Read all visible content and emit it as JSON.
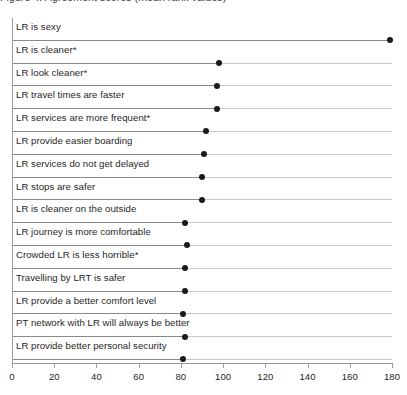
{
  "chart": {
    "title_clipped": "Figure 4: Agreement scores (mean rank values)",
    "xlabel": "",
    "ylabel": ""
  },
  "chart_data": {
    "type": "bar",
    "orientation": "horizontal",
    "style": "lollipop",
    "title": "Figure 4: Agreement scores (mean rank values)",
    "xlabel": "",
    "ylabel": "",
    "xlim": [
      0,
      180
    ],
    "xticks": [
      0,
      20,
      40,
      60,
      80,
      100,
      120,
      140,
      160,
      180
    ],
    "grid": false,
    "legend": null,
    "categories": [
      "LR is sexy",
      "LR is cleaner*",
      "LR look cleaner*",
      "LR travel times are faster",
      "LR services are more frequent*",
      "LR provide easier boarding",
      "LR services do not get delayed",
      "LR stops are safer",
      "LR is cleaner on the outside",
      "LR journey is more comfortable",
      "Crowded LR is less horrible*",
      "Travelling by LRT is safer",
      "LR provide a better comfort level",
      "PT network with LR will always be better",
      "LR provide better personal security"
    ],
    "values": [
      179,
      98,
      97,
      97,
      92,
      91,
      90,
      90,
      82,
      83,
      82,
      82,
      81,
      82,
      81
    ]
  },
  "axis": {
    "tick_labels": [
      "0",
      "20",
      "40",
      "60",
      "80",
      "100",
      "120",
      "140",
      "160",
      "180"
    ]
  },
  "colors": {
    "dot": "#1a1a1a",
    "stem": "#8a8a8a",
    "rule": "#c8c8c8",
    "axis": "#9a9a9a",
    "text": "#1f1f1f",
    "background": "#ffffff"
  }
}
